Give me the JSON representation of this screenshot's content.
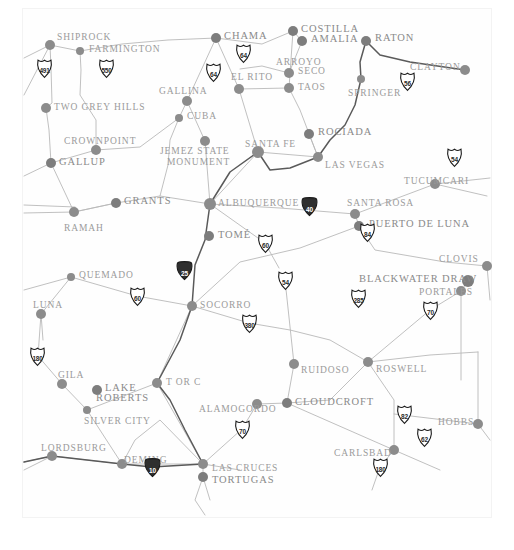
{
  "map": {
    "region": "New Mexico",
    "background_color": "#ffffff",
    "label_color": "#9b9b9b",
    "marker_color": "#8c8c8c",
    "road_color": "#b9b9b9",
    "highway_color": "#5a5a5a",
    "frame_color": "#f3f3f3",
    "width": 514,
    "height": 550
  },
  "cities": [
    {
      "name": "SHIPROCK",
      "x": 50,
      "y": 45,
      "lx": 57,
      "ly": 32,
      "r": 5,
      "major": false,
      "align": "left"
    },
    {
      "name": "FARMINGTON",
      "x": 80,
      "y": 51,
      "lx": 89,
      "ly": 44,
      "r": 4,
      "major": false,
      "align": "left"
    },
    {
      "name": "CHAMA",
      "x": 216,
      "y": 38,
      "lx": 224,
      "ly": 31,
      "r": 5,
      "major": true,
      "align": "left"
    },
    {
      "name": "COSTILLA",
      "x": 293,
      "y": 31,
      "lx": 301,
      "ly": 24,
      "r": 5,
      "major": true,
      "align": "left"
    },
    {
      "name": "AMALIA",
      "x": 302,
      "y": 41,
      "lx": 311,
      "ly": 34,
      "r": 5,
      "major": true,
      "align": "left"
    },
    {
      "name": "RATON",
      "x": 366,
      "y": 41,
      "lx": 375,
      "ly": 33,
      "r": 5,
      "major": true,
      "align": "left"
    },
    {
      "name": "CLAYTON",
      "x": 465,
      "y": 70,
      "lx": 410,
      "ly": 62,
      "r": 5,
      "major": false,
      "align": "left"
    },
    {
      "name": "EL RITO",
      "x": 239,
      "y": 89,
      "lx": 231,
      "ly": 72,
      "r": 5,
      "major": false,
      "align": "left"
    },
    {
      "name": "ARROYO",
      "x": 0,
      "y": 0,
      "lx": 276,
      "ly": 57,
      "r": 0,
      "major": false,
      "align": "left",
      "label_only": true
    },
    {
      "name": "SECO",
      "x": 289,
      "y": 73,
      "lx": 298,
      "ly": 66,
      "r": 5,
      "major": false,
      "align": "left"
    },
    {
      "name": "TAOS",
      "x": 289,
      "y": 88,
      "lx": 298,
      "ly": 82,
      "r": 5,
      "major": false,
      "align": "left"
    },
    {
      "name": "SPRINGER",
      "x": 361,
      "y": 79,
      "lx": 348,
      "ly": 88,
      "r": 4,
      "major": false,
      "align": "left"
    },
    {
      "name": "GALLINA",
      "x": 187,
      "y": 101,
      "lx": 159,
      "ly": 86,
      "r": 5,
      "major": false,
      "align": "left"
    },
    {
      "name": "TWO GREY HILLS",
      "x": 46,
      "y": 108,
      "lx": 54,
      "ly": 102,
      "r": 5,
      "major": false,
      "align": "left"
    },
    {
      "name": "CUBA",
      "x": 179,
      "y": 118,
      "lx": 187,
      "ly": 111,
      "r": 4,
      "major": false,
      "align": "left"
    },
    {
      "name": "ROCIADA",
      "x": 309,
      "y": 134,
      "lx": 318,
      "ly": 127,
      "r": 5,
      "major": true,
      "align": "left"
    },
    {
      "name": "CROWNPOINT",
      "x": 96,
      "y": 150,
      "lx": 64,
      "ly": 136,
      "r": 5,
      "major": false,
      "align": "left"
    },
    {
      "name": "JEMEZ STATE",
      "x": 205,
      "y": 141,
      "lx": 160,
      "ly": 146,
      "r": 5,
      "major": false,
      "align": "left"
    },
    {
      "name": "MONUMENT",
      "x": 0,
      "y": 0,
      "lx": 167,
      "ly": 157,
      "r": 0,
      "major": false,
      "align": "left",
      "label_only": true
    },
    {
      "name": "SANTA FE",
      "x": 258,
      "y": 152,
      "lx": 245,
      "ly": 139,
      "r": 6,
      "major": false,
      "align": "left"
    },
    {
      "name": "LAS VEGAS",
      "x": 318,
      "y": 157,
      "lx": 325,
      "ly": 160,
      "r": 5,
      "major": false,
      "align": "left"
    },
    {
      "name": "GALLUP",
      "x": 51,
      "y": 163,
      "lx": 59,
      "ly": 157,
      "r": 5,
      "major": true,
      "align": "left"
    },
    {
      "name": "TUCUMCARI",
      "x": 435,
      "y": 184,
      "lx": 404,
      "ly": 176,
      "r": 5,
      "major": false,
      "align": "left"
    },
    {
      "name": "GRANTS",
      "x": 116,
      "y": 203,
      "lx": 124,
      "ly": 196,
      "r": 5,
      "major": true,
      "align": "left"
    },
    {
      "name": "ALBUQUERQUE",
      "x": 210,
      "y": 204,
      "lx": 218,
      "ly": 198,
      "r": 6,
      "major": false,
      "align": "left"
    },
    {
      "name": "SANTA ROSA",
      "x": 355,
      "y": 214,
      "lx": 347,
      "ly": 198,
      "r": 5,
      "major": false,
      "align": "left"
    },
    {
      "name": "RAMAH",
      "x": 74,
      "y": 212,
      "lx": 64,
      "ly": 223,
      "r": 5,
      "major": false,
      "align": "left"
    },
    {
      "name": "PUERTO DE LUNA",
      "x": 359,
      "y": 226,
      "lx": 369,
      "ly": 219,
      "r": 5,
      "major": true,
      "align": "left"
    },
    {
      "name": "TOMÉ",
      "x": 209,
      "y": 236,
      "lx": 218,
      "ly": 230,
      "r": 5,
      "major": true,
      "align": "left"
    },
    {
      "name": "CLOVIS",
      "x": 487,
      "y": 266,
      "lx": 439,
      "ly": 254,
      "r": 5,
      "major": false,
      "align": "left"
    },
    {
      "name": "QUEMADO",
      "x": 71,
      "y": 277,
      "lx": 79,
      "ly": 270,
      "r": 4,
      "major": false,
      "align": "left"
    },
    {
      "name": "BLACKWATER DRAW",
      "x": 468,
      "y": 281,
      "lx": 359,
      "ly": 274,
      "r": 6,
      "major": true,
      "align": "left"
    },
    {
      "name": "PORTALES",
      "x": 461,
      "y": 291,
      "lx": 419,
      "ly": 287,
      "r": 5,
      "major": false,
      "align": "left"
    },
    {
      "name": "SOCORRO",
      "x": 192,
      "y": 306,
      "lx": 200,
      "ly": 300,
      "r": 5,
      "major": false,
      "align": "left"
    },
    {
      "name": "LUNA",
      "x": 41,
      "y": 314,
      "lx": 33,
      "ly": 300,
      "r": 5,
      "major": false,
      "align": "left"
    },
    {
      "name": "RUIDOSO",
      "x": 294,
      "y": 364,
      "lx": 301,
      "ly": 365,
      "r": 5,
      "major": false,
      "align": "left"
    },
    {
      "name": "ROSWELL",
      "x": 368,
      "y": 362,
      "lx": 376,
      "ly": 364,
      "r": 5,
      "major": false,
      "align": "left"
    },
    {
      "name": "GILA",
      "x": 62,
      "y": 384,
      "lx": 58,
      "ly": 370,
      "r": 5,
      "major": false,
      "align": "left"
    },
    {
      "name": "T OR C",
      "x": 157,
      "y": 383,
      "lx": 166,
      "ly": 377,
      "r": 5,
      "major": false,
      "align": "left"
    },
    {
      "name": "LAKE",
      "x": 97,
      "y": 390,
      "lx": 105,
      "ly": 383,
      "r": 5,
      "major": true,
      "align": "left"
    },
    {
      "name": "ROBERTS",
      "x": 0,
      "y": 0,
      "lx": 96,
      "ly": 393,
      "r": 0,
      "major": true,
      "align": "left",
      "label_only": true
    },
    {
      "name": "CLOUDCROFT",
      "x": 287,
      "y": 403,
      "lx": 295,
      "ly": 397,
      "r": 5,
      "major": true,
      "align": "left"
    },
    {
      "name": "ALAMOGORDO",
      "x": 257,
      "y": 404,
      "lx": 199,
      "ly": 404,
      "r": 5,
      "major": false,
      "align": "left"
    },
    {
      "name": "SILVER CITY",
      "x": 87,
      "y": 410,
      "lx": 84,
      "ly": 416,
      "r": 4,
      "major": false,
      "align": "left"
    },
    {
      "name": "HOBBS",
      "x": 478,
      "y": 424,
      "lx": 438,
      "ly": 417,
      "r": 5,
      "major": false,
      "align": "left"
    },
    {
      "name": "CARLSBAD",
      "x": 394,
      "y": 450,
      "lx": 334,
      "ly": 448,
      "r": 5,
      "major": false,
      "align": "left"
    },
    {
      "name": "LORDSBURG",
      "x": 52,
      "y": 456,
      "lx": 41,
      "ly": 443,
      "r": 5,
      "major": false,
      "align": "left"
    },
    {
      "name": "DEMING",
      "x": 122,
      "y": 464,
      "lx": 124,
      "ly": 455,
      "r": 5,
      "major": false,
      "align": "left"
    },
    {
      "name": "LAS CRUCES",
      "x": 203,
      "y": 464,
      "lx": 212,
      "ly": 463,
      "r": 5,
      "major": false,
      "align": "left"
    },
    {
      "name": "TORTUGAS",
      "x": 203,
      "y": 477,
      "lx": 212,
      "ly": 475,
      "r": 5,
      "major": true,
      "align": "left"
    }
  ],
  "shields": [
    {
      "number": "491",
      "x": 44,
      "y": 68,
      "type": "us"
    },
    {
      "number": "550",
      "x": 106,
      "y": 68,
      "type": "us"
    },
    {
      "number": "64",
      "x": 243,
      "y": 53,
      "type": "us"
    },
    {
      "number": "64",
      "x": 213,
      "y": 72,
      "type": "us"
    },
    {
      "number": "56",
      "x": 407,
      "y": 81,
      "type": "us"
    },
    {
      "number": "54",
      "x": 454,
      "y": 157,
      "type": "us"
    },
    {
      "number": "40",
      "x": 309,
      "y": 206,
      "type": "interstate"
    },
    {
      "number": "84",
      "x": 367,
      "y": 232,
      "type": "us"
    },
    {
      "number": "60",
      "x": 265,
      "y": 243,
      "type": "us"
    },
    {
      "number": "60",
      "x": 137,
      "y": 296,
      "type": "us"
    },
    {
      "number": "25",
      "x": 184,
      "y": 270,
      "type": "interstate"
    },
    {
      "number": "54",
      "x": 285,
      "y": 280,
      "type": "us"
    },
    {
      "number": "285",
      "x": 358,
      "y": 298,
      "type": "us"
    },
    {
      "number": "70",
      "x": 430,
      "y": 310,
      "type": "us"
    },
    {
      "number": "380",
      "x": 249,
      "y": 323,
      "type": "us"
    },
    {
      "number": "180",
      "x": 37,
      "y": 356,
      "type": "us"
    },
    {
      "number": "70",
      "x": 242,
      "y": 429,
      "type": "us"
    },
    {
      "number": "82",
      "x": 404,
      "y": 414,
      "type": "us"
    },
    {
      "number": "62",
      "x": 424,
      "y": 437,
      "type": "us"
    },
    {
      "number": "180",
      "x": 380,
      "y": 467,
      "type": "us"
    },
    {
      "number": "10",
      "x": 152,
      "y": 467,
      "type": "interstate"
    }
  ],
  "roads": {
    "minor": [
      "M 24,58 L 50,45 L 80,51 L 122,44 L 168,40 L 216,38 L 262,44 L 293,31",
      "M 24,95 L 50,45",
      "M 50,45 L 51,68 L 52,103 L 46,108 L 49,130 L 51,163",
      "M 80,51 L 81,70 L 80,95 L 96,120 L 96,150 L 51,163",
      "M 51,163 L 24,176 M 51,163 L 74,212 L 116,203",
      "M 116,203 L 74,212",
      "M 24,213 L 74,212",
      "M 116,203 L 160,196 L 210,204",
      "M 24,205 L 75,207",
      "M 96,150 L 140,147 L 179,118 L 187,101 L 216,38",
      "M 187,101 L 205,141 L 210,204",
      "M 179,118 L 170,140 L 168,165 L 160,196",
      "M 216,38 L 239,89 L 258,152",
      "M 239,89 L 289,88",
      "M 289,88 L 293,31 M 289,73 L 262,66 L 240,69",
      "M 293,31 L 302,41 L 289,73",
      "M 289,88 L 300,110 L 318,157 L 309,134",
      "M 258,152 L 318,157",
      "M 258,152 L 210,204",
      "M 210,204 L 265,243 L 279,268",
      "M 210,204 L 280,208 L 355,214 L 435,184 L 490,178",
      "M 435,184 L 487,196",
      "M 355,214 L 359,226 L 375,250 L 445,262 L 487,266",
      "M 359,226 L 300,248 L 240,262 L 192,306",
      "M 192,306 L 137,296 L 71,277 L 24,290",
      "M 71,277 L 41,314 L 43,340",
      "M 192,306 L 249,323 L 290,330 L 330,340 L 368,362",
      "M 285,280 L 294,364 L 287,403",
      "M 192,306 L 157,383 L 203,464",
      "M 41,314 L 38,356 L 62,384 L 87,410 L 122,464",
      "M 87,410 L 157,383",
      "M 24,462 L 52,456 L 122,464 L 203,464 L 240,470",
      "M 122,464 L 135,440 L 160,420 L 203,464",
      "M 203,464 L 203,477 L 210,500",
      "M 203,464 L 242,429 L 257,404 L 287,403 L 330,400 L 368,362",
      "M 287,403 L 394,450",
      "M 368,362 L 394,400 L 394,450 L 440,470",
      "M 368,362 L 430,355 L 478,352",
      "M 478,352 L 478,424 L 490,440",
      "M 394,414 L 478,424",
      "M 468,281 L 461,291 L 430,310 L 368,362",
      "M 487,266 L 490,300",
      "M 461,291 L 461,380",
      "M 52,456 L 24,470",
      "M 394,450 L 380,467 L 372,490",
      "M 203,477 L 195,500 L 205,515"
    ],
    "highway": [
      "M 366,41 L 360,62 L 361,79 L 355,105 L 345,125 L 330,140 L 318,157 L 290,168 L 270,170 L 258,152",
      "M 258,152 L 230,172 L 210,204 L 205,240 L 195,265 L 192,306 L 180,340 L 157,383 L 170,400 L 185,430 L 203,464",
      "M 366,41 L 380,55 L 410,62 L 465,70",
      "M 203,464 L 152,467 L 122,464 L 52,456 L 24,462"
    ]
  }
}
